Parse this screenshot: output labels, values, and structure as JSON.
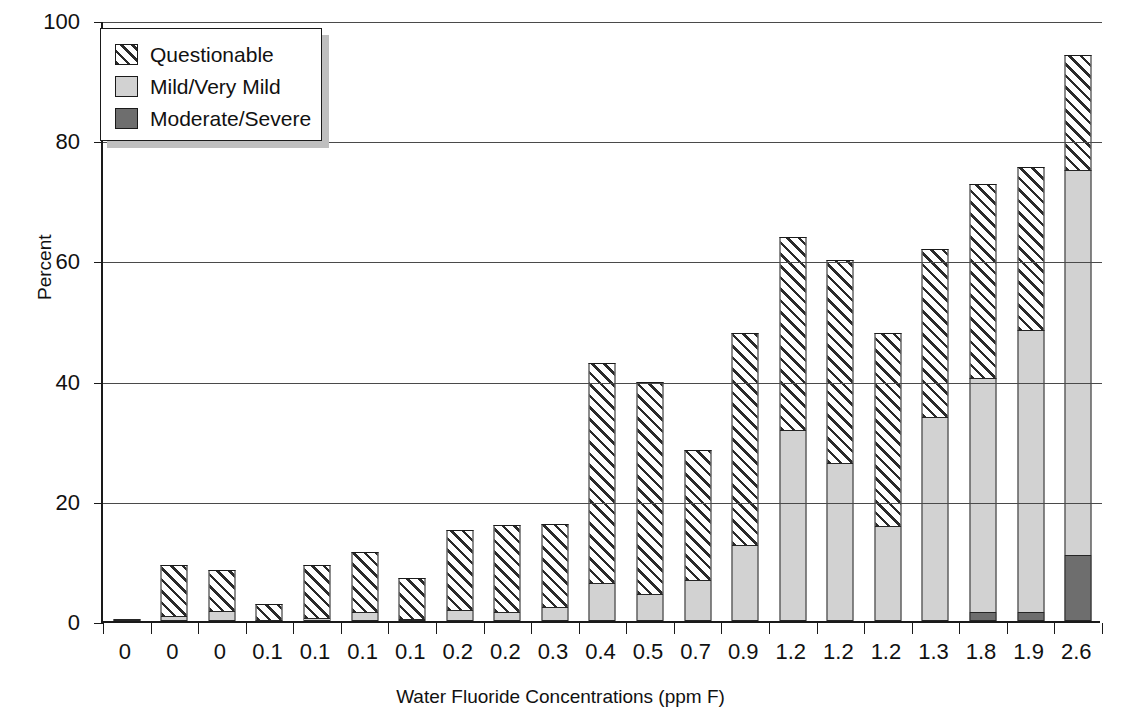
{
  "chart_data": {
    "type": "bar",
    "stacked": true,
    "title": "",
    "xlabel": "Water Fluoride Concentrations (ppm F)",
    "ylabel": "Percent",
    "ylim": [
      0,
      100
    ],
    "yticks": [
      0,
      20,
      40,
      60,
      80,
      100
    ],
    "grid": "horizontal",
    "legend_position": "top-left",
    "categories": [
      "0",
      "0",
      "0",
      "0.1",
      "0.1",
      "0.1",
      "0.1",
      "0.2",
      "0.2",
      "0.3",
      "0.4",
      "0.5",
      "0.7",
      "0.9",
      "1.2",
      "1.2",
      "1.2",
      "1.3",
      "1.8",
      "1.9",
      "2.6"
    ],
    "series": [
      {
        "name": "Moderate/Severe",
        "color": "#6e6e6e",
        "values": [
          0.4,
          0,
          0,
          0,
          0,
          0,
          0,
          0,
          0,
          0,
          0,
          0,
          0,
          0,
          0,
          0,
          0,
          0,
          1.5,
          1.5,
          11.0
        ]
      },
      {
        "name": "Mild/Very Mild",
        "color": "#d2d2d2",
        "values": [
          0,
          0.9,
          1.6,
          0,
          0.5,
          1.5,
          0.3,
          1.8,
          1.5,
          2.3,
          6.3,
          4.5,
          6.8,
          12.7,
          31.8,
          26.3,
          15.8,
          34.0,
          39.0,
          47.0,
          64.0
        ]
      },
      {
        "name": "Questionable",
        "color": "#ffffff",
        "values": [
          0,
          8.4,
          6.9,
          2.9,
          8.9,
          10.0,
          6.9,
          13.3,
          14.5,
          13.8,
          36.7,
          35.3,
          21.6,
          35.3,
          32.1,
          33.7,
          32.2,
          27.9,
          32.2,
          27.0,
          19.2
        ]
      }
    ],
    "totals": [
      0.4,
      9.3,
      8.5,
      2.9,
      9.4,
      11.5,
      7.2,
      15.1,
      16.0,
      16.1,
      43.0,
      39.8,
      28.4,
      48.0,
      63.9,
      60.0,
      48.0,
      61.9,
      72.7,
      75.5,
      94.2
    ]
  },
  "legend": {
    "items": [
      {
        "label": "Questionable",
        "swatch": "hatched-swatch"
      },
      {
        "label": "Mild/Very Mild",
        "swatch": "light-gray-swatch"
      },
      {
        "label": "Moderate/Severe",
        "swatch": "dark-gray-swatch"
      }
    ]
  }
}
